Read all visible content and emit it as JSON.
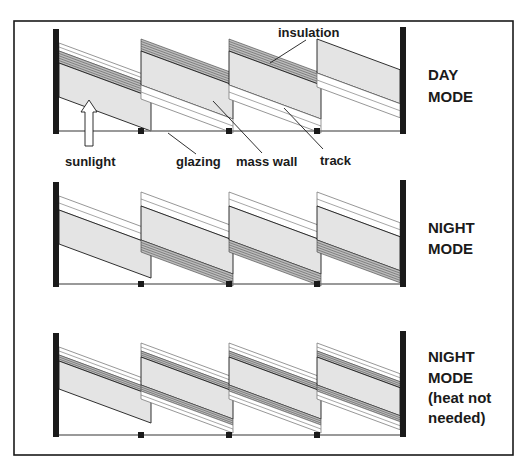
{
  "colors": {
    "ink": "#1a1a1a",
    "mass_fill": "#e4e4e4",
    "insulation_line": "#3a3a3a",
    "track_line": "#6a6a6a",
    "glazing_line": "#777777",
    "background": "#ffffff"
  },
  "frame": {
    "x": 14,
    "y": 21,
    "w": 499,
    "h": 434
  },
  "callouts": {
    "insulation": "insulation",
    "sunlight": "sunlight",
    "glazing": "glazing",
    "mass_wall": "mass wall",
    "track": "track"
  },
  "rows": [
    {
      "id": "day-mode",
      "mode_lines": [
        "DAY",
        "MODE"
      ],
      "label_y": [
        75,
        97
      ],
      "wall_top": 29,
      "wall_bottom": 134,
      "glazing_y": 131,
      "insulation_position": "top",
      "track_position": "below"
    },
    {
      "id": "night-mode",
      "mode_lines": [
        "NIGHT",
        "MODE"
      ],
      "label_y": [
        228,
        249
      ],
      "wall_top": 182,
      "wall_bottom": 287,
      "glazing_y": 284,
      "insulation_position": "bottom",
      "track_position": "above"
    },
    {
      "id": "night-mode-heat-not-needed",
      "mode_lines": [
        "NIGHT",
        "MODE",
        "(heat not",
        "needed)"
      ],
      "label_y": [
        357,
        378,
        398,
        418
      ],
      "wall_top": 333,
      "wall_bottom": 437,
      "glazing_y": 435,
      "insulation_position": "split",
      "track_position": "both"
    }
  ],
  "diagram": {
    "left_wall_x": 53,
    "right_wall_x": 400,
    "wall_width": 6,
    "slat_count": 4,
    "slat_pitch": 88,
    "clip_x": [
      141,
      229,
      317
    ],
    "slope": 0.37
  }
}
